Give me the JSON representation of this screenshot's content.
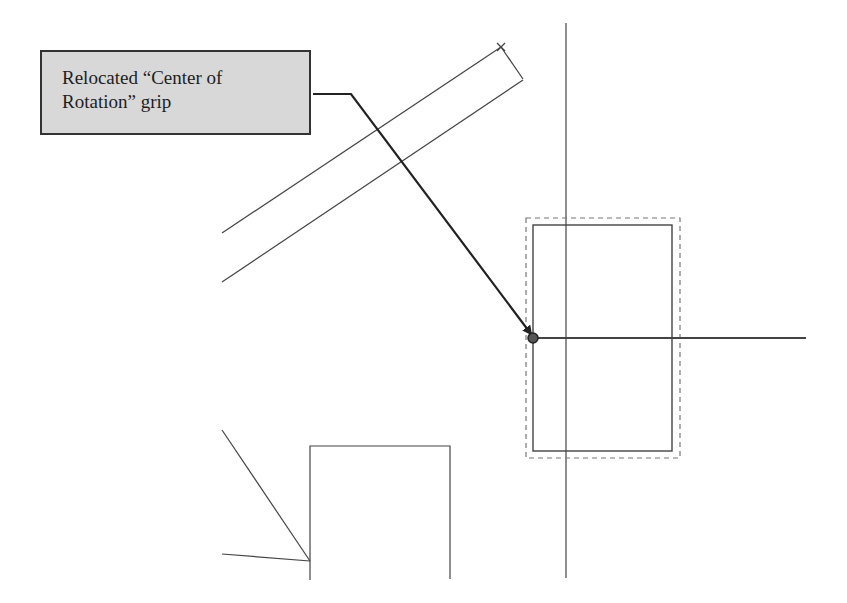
{
  "callout": {
    "line1": "Relocated “Center of",
    "line2": "Rotation” grip"
  },
  "colors": {
    "background": "#ffffff",
    "callout_fill": "#d8d8d8",
    "callout_border": "#333333",
    "line": "#333333",
    "leader": "#222222",
    "selection_dash": "#777777"
  }
}
